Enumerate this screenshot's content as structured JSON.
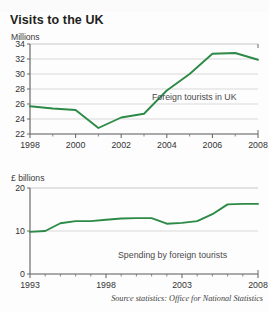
{
  "figure": {
    "title": "Visits to the UK",
    "source_note": "Source statistics: Office for National Statistics",
    "line_color": "#2c8a46",
    "grid_color": "#cfcfcf",
    "axis_color": "#6b6b6b",
    "text_color": "#333333"
  },
  "chart_data": [
    {
      "type": "line",
      "title": "Visits to the UK",
      "subtitle": "Foreign tourists in UK",
      "ylabel": "Millions",
      "xlabel": "",
      "annotation": "Foreign tourists in UK",
      "grid": true,
      "legend": "none",
      "xlim": [
        1998,
        2008
      ],
      "ylim": [
        22,
        34
      ],
      "yticks": [
        22,
        24,
        26,
        28,
        30,
        32,
        34
      ],
      "ytick_labels": [
        "22",
        "24",
        "26",
        "28",
        "30",
        "32",
        "34"
      ],
      "xticks": [
        1998,
        1999,
        2000,
        2001,
        2002,
        2003,
        2004,
        2005,
        2006,
        2007,
        2008
      ],
      "xtick_labels_major": [
        "1998",
        "2000",
        "2002",
        "2004",
        "2006",
        "2008"
      ],
      "x": [
        1998,
        1999,
        2000,
        2001,
        2002,
        2003,
        2004,
        2005,
        2006,
        2007,
        2008
      ],
      "values": [
        25.7,
        25.4,
        25.2,
        22.8,
        24.2,
        24.7,
        27.8,
        30.0,
        32.7,
        32.8,
        31.9
      ],
      "series": [
        {
          "name": "Foreign tourists in UK",
          "values": [
            25.7,
            25.4,
            25.2,
            22.8,
            24.2,
            24.7,
            27.8,
            30.0,
            32.7,
            32.8,
            31.9
          ]
        }
      ]
    },
    {
      "type": "line",
      "title": "Spending by foreign tourists",
      "ylabel": "£ billions",
      "xlabel": "",
      "annotation": "Spending by foreign tourists",
      "grid": true,
      "legend": "none",
      "xlim": [
        1993,
        2008
      ],
      "ylim": [
        0,
        20
      ],
      "yticks": [
        0,
        10,
        20
      ],
      "ytick_labels": [
        "0",
        "10",
        "20"
      ],
      "xticks": [
        1993,
        1994,
        1995,
        1996,
        1997,
        1998,
        1999,
        2000,
        2001,
        2002,
        2003,
        2004,
        2005,
        2006,
        2007,
        2008
      ],
      "xtick_labels_major": [
        "1993",
        "1998",
        "2003",
        "2008"
      ],
      "x": [
        1993,
        1994,
        1995,
        1996,
        1997,
        1998,
        1999,
        2000,
        2001,
        2002,
        2003,
        2004,
        2005,
        2006,
        2007,
        2008
      ],
      "values": [
        9.8,
        10.0,
        11.8,
        12.3,
        12.3,
        12.6,
        12.9,
        13.0,
        13.0,
        11.7,
        11.9,
        12.3,
        13.9,
        16.2,
        16.3,
        16.3
      ],
      "series": [
        {
          "name": "Spending by foreign tourists",
          "values": [
            9.8,
            10.0,
            11.8,
            12.3,
            12.3,
            12.6,
            12.9,
            13.0,
            13.0,
            11.7,
            11.9,
            12.3,
            13.9,
            16.2,
            16.3,
            16.3
          ]
        }
      ]
    }
  ]
}
